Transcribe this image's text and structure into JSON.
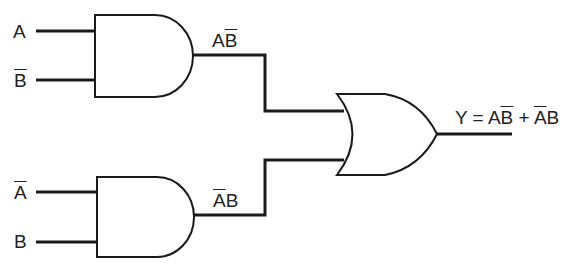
{
  "diagram": {
    "type": "logic-circuit",
    "inputs": {
      "gate1_in1": "A",
      "gate1_in2": "B",
      "gate1_in2_inverted": true,
      "gate2_in1": "A",
      "gate2_in1_inverted": true,
      "gate2_in2": "B"
    },
    "labels": {
      "and1_input_a": "A",
      "and1_input_bbar": "B",
      "and2_input_abar": "A",
      "and2_input_b": "B",
      "and1_output_a": "A",
      "and1_output_bbar": "B",
      "and2_output_abar": "A",
      "and2_output_b": "B",
      "or_output_y": "Y = A",
      "or_output_bbar": "B",
      "or_output_plus": " + ",
      "or_output_abar": "A",
      "or_output_b": "B"
    },
    "gates": [
      {
        "id": "and1",
        "kind": "AND",
        "output": "AB̄"
      },
      {
        "id": "and2",
        "kind": "AND",
        "output": "ĀB"
      },
      {
        "id": "or1",
        "kind": "OR",
        "output": "Y = AB̄ + ĀB"
      }
    ],
    "colors": {
      "line": "#1a1a1a",
      "background": "#ffffff"
    }
  }
}
